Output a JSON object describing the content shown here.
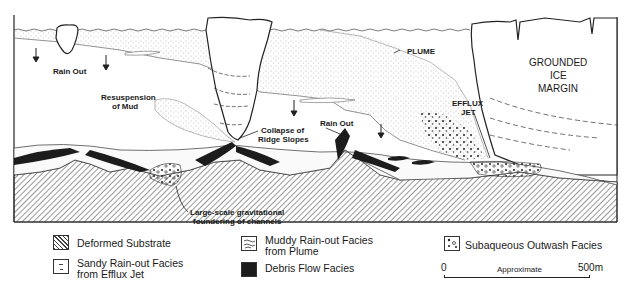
{
  "figure": {
    "labels": {
      "rain_out_left": "Rain Out",
      "rain_out_mid": "Rain Out",
      "plume": "PLUME",
      "ice_margin_1": "GROUNDED",
      "ice_margin_2": "ICE",
      "ice_margin_3": "MARGIN",
      "efflux_1": "EFFLUX",
      "efflux_2": "JET",
      "resuspension_1": "Resuspension",
      "resuspension_2": "of Mud",
      "collapse_1": "Collapse of",
      "collapse_2": "Ridge Slopes",
      "foundering_1": "Large-scale gravitational",
      "foundering_2": "foundering of channels"
    }
  },
  "legend": {
    "items": [
      {
        "id": "deformed",
        "label": "Deformed Substrate",
        "pattern": "diagonal-hatch"
      },
      {
        "id": "sandy",
        "label_1": "Sandy Rain-out Facies",
        "label_2": "from Efflux Jet",
        "pattern": "dashes"
      },
      {
        "id": "muddy",
        "label_1": "Muddy Rain-out Facies",
        "label_2": "from Plume",
        "pattern": "wavy-lines"
      },
      {
        "id": "debris",
        "label": "Debris Flow Facies",
        "pattern": "solid-dark"
      },
      {
        "id": "outwash",
        "label": "Subaqueous Outwash Facies",
        "pattern": "dots-circles"
      }
    ]
  },
  "scale_bar": {
    "start": "0",
    "end": "500m",
    "caption": "Approximate"
  },
  "colors": {
    "ink": "#1a1a1a",
    "debris": "#1c1c1c",
    "background": "#ffffff"
  }
}
